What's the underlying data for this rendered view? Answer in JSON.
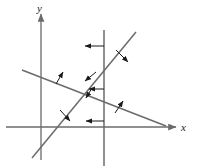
{
  "figure": {
    "name": "linear-inequalities-graph",
    "background": "#ffffff",
    "line_color": "#6b6b6b",
    "axis_color": "#6b6b6b",
    "arrow_color": "#1a1a1a",
    "width": 197,
    "height": 168
  },
  "axes": {
    "x_label": "x",
    "y_label": "y",
    "origin": {
      "x": 41,
      "y": 127
    },
    "x_axis": {
      "x1": 6,
      "y1": 127,
      "x2": 176,
      "y2": 127
    },
    "y_axis": {
      "x1": 41,
      "y1": 160,
      "x2": 41,
      "y2": 14
    },
    "x_label_pos": {
      "x": 181,
      "y": 131
    },
    "y_label_pos": {
      "x": 37,
      "y": 12
    }
  },
  "chart_data": {
    "type": "line",
    "title": "",
    "xlabel": "x",
    "ylabel": "y",
    "grid": false,
    "legend": "none",
    "lines": [
      {
        "name": "vertical-constraint-line",
        "kind": "vertical",
        "x1": 104,
        "y1": 30,
        "x2": 104,
        "y2": 166,
        "shading_direction": "left"
      },
      {
        "name": "rising-constraint-line",
        "kind": "positive-slope",
        "x1": 32,
        "y1": 158,
        "x2": 136,
        "y2": 32,
        "shading_direction": "down-right-and-down-left"
      },
      {
        "name": "falling-constraint-line",
        "kind": "negative-slope",
        "x1": 22,
        "y1": 70,
        "x2": 166,
        "y2": 126,
        "shading_direction": "up-right"
      }
    ],
    "arrows": [
      {
        "name": "arrow-vertical-upper",
        "from": {
          "x": 104,
          "y": 46
        },
        "to": {
          "x": 85,
          "y": 46
        },
        "style": "horizontal-left"
      },
      {
        "name": "arrow-vertical-middle",
        "from": {
          "x": 104,
          "y": 89
        },
        "to": {
          "x": 89,
          "y": 89
        },
        "style": "horizontal-left"
      },
      {
        "name": "arrow-vertical-lower",
        "from": {
          "x": 104,
          "y": 121
        },
        "to": {
          "x": 86,
          "y": 121
        },
        "style": "horizontal-left"
      },
      {
        "name": "arrow-rising-upper",
        "from": {
          "x": 116,
          "y": 50
        },
        "to": {
          "x": 128,
          "y": 62
        },
        "style": "perpendicular-down-right"
      },
      {
        "name": "arrow-rising-middle",
        "from": {
          "x": 96,
          "y": 72
        },
        "to": {
          "x": 85,
          "y": 81
        },
        "style": "perpendicular-down-left"
      },
      {
        "name": "arrow-rising-middle2",
        "from": {
          "x": 92,
          "y": 88
        },
        "to": {
          "x": 86,
          "y": 98
        },
        "style": "perpendicular-down-left"
      },
      {
        "name": "arrow-rising-lower",
        "from": {
          "x": 60,
          "y": 110
        },
        "to": {
          "x": 70,
          "y": 121
        },
        "style": "perpendicular-down-right"
      },
      {
        "name": "arrow-falling-left",
        "from": {
          "x": 56,
          "y": 84
        },
        "to": {
          "x": 63,
          "y": 72
        },
        "style": "perpendicular-up-right"
      },
      {
        "name": "arrow-falling-right",
        "from": {
          "x": 115,
          "y": 113
        },
        "to": {
          "x": 123,
          "y": 101
        },
        "style": "perpendicular-up-right"
      }
    ]
  }
}
